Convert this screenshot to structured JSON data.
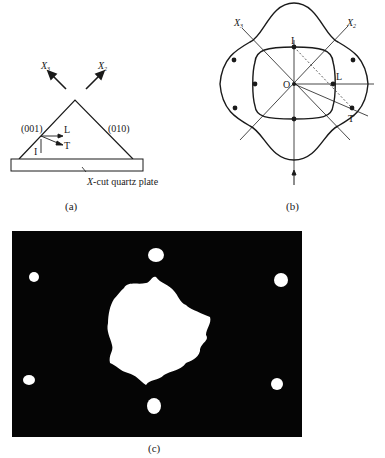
{
  "figure": {
    "panel_a": {
      "caption": "(a)",
      "axis_labels": [
        {
          "name": "X",
          "sub": "3"
        },
        {
          "name": "X",
          "sub": "2"
        }
      ],
      "face_left": "(001)",
      "face_right": "(010)",
      "wave_labels": {
        "incident": "I",
        "longitudinal": "L",
        "transverse": "T"
      },
      "plate_label_italic": "X",
      "plate_label_rest": "-cut quartz plate"
    },
    "panel_b": {
      "caption": "(b)",
      "axis_labels": [
        {
          "name": "X",
          "sub": "3"
        },
        {
          "name": "X",
          "sub": "2"
        }
      ],
      "points": {
        "incident": "I",
        "origin": "O",
        "longitudinal": "L",
        "transverse": "T"
      }
    },
    "panel_c": {
      "caption": "(c)",
      "description": "photograph of diffraction spots: large central bright spot surrounded by six small spots on a black background"
    }
  }
}
